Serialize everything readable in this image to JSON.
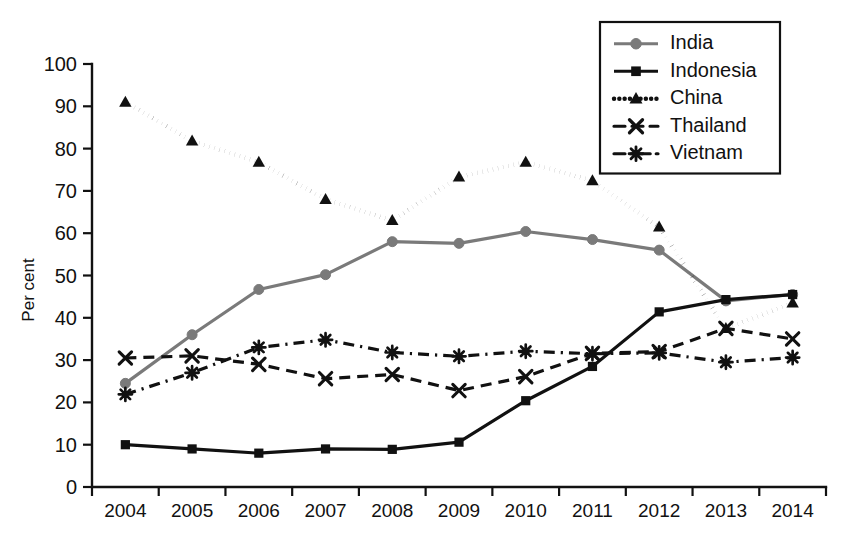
{
  "chart_data": {
    "type": "line",
    "title": "",
    "xlabel": "",
    "ylabel": "Per cent",
    "categories": [
      "2004",
      "2005",
      "2006",
      "2007",
      "2008",
      "2009",
      "2010",
      "2011",
      "2012",
      "2013",
      "2014"
    ],
    "ylim": [
      0,
      100
    ],
    "ytick_labels": [
      "0",
      "10",
      "20",
      "30",
      "40",
      "50",
      "60",
      "70",
      "80",
      "90",
      "100"
    ],
    "ytick_values": [
      0,
      10,
      20,
      30,
      40,
      50,
      60,
      70,
      80,
      90,
      100
    ],
    "grid": false,
    "legend_position": "top-right",
    "series": [
      {
        "name": "India",
        "color": "#7a7a7a",
        "marker": "circle",
        "dash": "none",
        "values": [
          24.5,
          36,
          46.7,
          50.2,
          58,
          57.6,
          60.4,
          58.5,
          56,
          44,
          45.5
        ]
      },
      {
        "name": "Indonesia",
        "color": "#111111",
        "marker": "square",
        "dash": "none",
        "values": [
          10,
          9,
          8,
          9,
          8.9,
          10.6,
          20.4,
          28.5,
          41.4,
          44.3,
          45.5
        ]
      },
      {
        "name": "China",
        "color": "#111111",
        "marker": "triangle",
        "dash": "dotted",
        "values": [
          91,
          81.8,
          76.8,
          68,
          63,
          73.3,
          76.8,
          72.4,
          61.5,
          37.5,
          43.5
        ]
      },
      {
        "name": "Thailand",
        "color": "#111111",
        "marker": "x",
        "dash": "dashed",
        "values": [
          30.5,
          31,
          29,
          25.6,
          26.6,
          22.8,
          26.1,
          31.6,
          32,
          37.5,
          35
        ]
      },
      {
        "name": "Vietnam",
        "color": "#111111",
        "marker": "asterisk",
        "dash": "dashdot",
        "values": [
          21.9,
          27,
          33,
          34.8,
          31.8,
          30.9,
          32.1,
          31.5,
          31.7,
          29.5,
          30.6
        ]
      }
    ]
  }
}
